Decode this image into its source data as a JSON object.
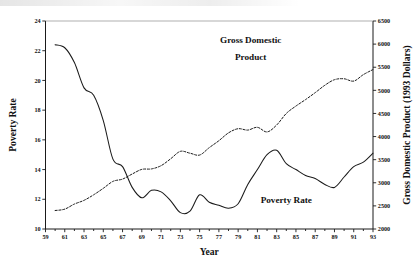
{
  "chart_data": {
    "type": "line",
    "title": "",
    "xlabel": "Year",
    "ylabel": "Poverty Rate",
    "y2label": "Gross Domestic Product (1993 Dollars)",
    "grid": false,
    "legend_position": "inline-annotations",
    "xlim": [
      59,
      93
    ],
    "ylim": [
      10,
      24
    ],
    "y2lim": [
      2000,
      6500
    ],
    "xticks": [
      59,
      61,
      63,
      65,
      67,
      69,
      71,
      73,
      75,
      77,
      79,
      81,
      83,
      85,
      87,
      89,
      91,
      93
    ],
    "xtick_labels": [
      "59",
      "61",
      "63",
      "65",
      "67",
      "69",
      "71",
      "73",
      "75",
      "77",
      "79",
      "81",
      "83",
      "85",
      "87",
      "89",
      "91",
      "93"
    ],
    "yticks": [
      10,
      12,
      14,
      16,
      18,
      20,
      22,
      24
    ],
    "ytick_labels": [
      "10",
      "12",
      "14",
      "16",
      "18",
      "20",
      "22",
      "24"
    ],
    "y2ticks": [
      2000,
      2500,
      3000,
      3500,
      4000,
      4500,
      5000,
      5500,
      6000,
      6500
    ],
    "y2tick_labels": [
      "2000",
      "2500",
      "3000",
      "3500",
      "4000",
      "4500",
      "5000",
      "5500",
      "6000",
      "6500"
    ],
    "annotations": [
      {
        "text": "Gross Domestic",
        "x": 80.3,
        "y": 22.55
      },
      {
        "text": "Product",
        "x": 80.3,
        "y": 21.4
      },
      {
        "text": "Poverty Rate",
        "x": 84.0,
        "y": 11.75
      }
    ],
    "series": [
      {
        "name": "Poverty Rate",
        "axis": "left",
        "style": "solid",
        "color": "#1a1a1a",
        "x": [
          60,
          61,
          62,
          63,
          64,
          65,
          66,
          67,
          68,
          69,
          70,
          71,
          72,
          73,
          74,
          75,
          76,
          77,
          78,
          79,
          80,
          81,
          82,
          83,
          84,
          85,
          86,
          87,
          88,
          89,
          90,
          91,
          92,
          93
        ],
        "values": [
          22.4,
          22.2,
          21.2,
          19.5,
          19.0,
          17.3,
          14.7,
          14.2,
          12.8,
          12.1,
          12.6,
          12.5,
          11.9,
          11.1,
          11.2,
          12.3,
          11.8,
          11.6,
          11.4,
          11.7,
          13.0,
          14.0,
          15.0,
          15.3,
          14.4,
          14.0,
          13.6,
          13.4,
          13.0,
          12.8,
          13.5,
          14.2,
          14.5,
          15.1
        ]
      },
      {
        "name": "Gross Domestic Product",
        "axis": "right",
        "style": "dashed",
        "color": "#1a1a1a",
        "x": [
          60,
          61,
          62,
          63,
          64,
          65,
          66,
          67,
          68,
          69,
          70,
          71,
          72,
          73,
          74,
          75,
          76,
          77,
          78,
          79,
          80,
          81,
          82,
          83,
          84,
          85,
          86,
          87,
          88,
          89,
          90,
          91,
          92,
          93
        ],
        "values": [
          2400,
          2430,
          2540,
          2620,
          2740,
          2880,
          3030,
          3080,
          3190,
          3290,
          3300,
          3370,
          3520,
          3680,
          3640,
          3600,
          3760,
          3910,
          4080,
          4170,
          4140,
          4200,
          4100,
          4250,
          4500,
          4660,
          4800,
          4950,
          5110,
          5230,
          5250,
          5200,
          5340,
          5450
        ]
      }
    ]
  }
}
